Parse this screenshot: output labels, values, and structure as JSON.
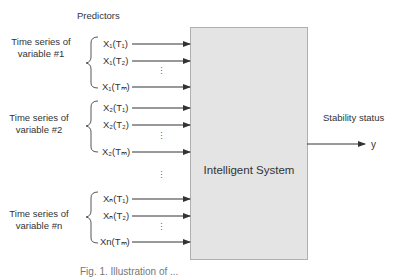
{
  "header": {
    "title": "Predictors"
  },
  "groups": [
    {
      "label_line1": "Time series of",
      "label_line2": "variable #1",
      "inputs": [
        "X₁(T₁)",
        "X₁(T₂)",
        "X₁(Tₘ)"
      ]
    },
    {
      "label_line1": "Time series of",
      "label_line2": "variable #2",
      "inputs": [
        "X₂(T₁)",
        "X₂(T₂)",
        "X₂(Tₘ)"
      ]
    },
    {
      "label_line1": "Time series of",
      "label_line2": "variable #n",
      "inputs": [
        "Xₙ(T₁)",
        "Xₙ(T₂)",
        "Xn(Tₘ)"
      ]
    }
  ],
  "ellipsis": "⋮",
  "system": {
    "label": "Intelligent System"
  },
  "output": {
    "title": "Stability status",
    "variable": "y"
  },
  "caption": "Fig. 1. Illustration of ..."
}
